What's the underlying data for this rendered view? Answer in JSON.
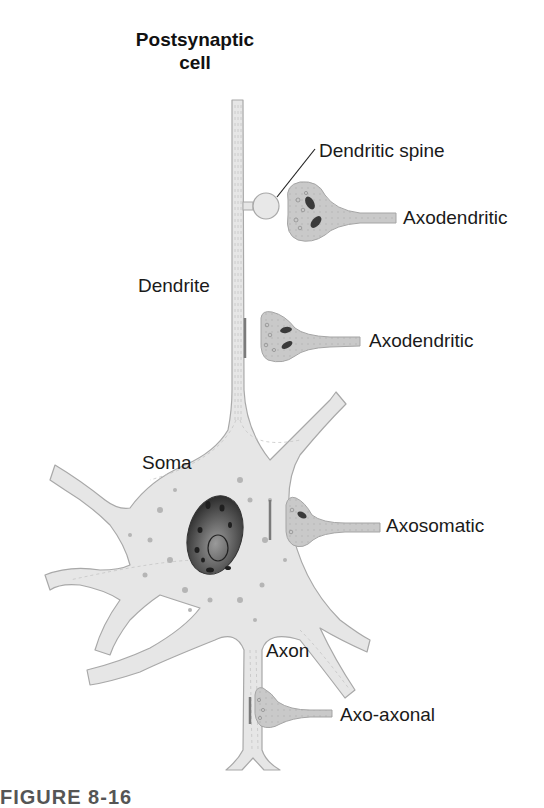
{
  "diagram": {
    "title_line1": "Postsynaptic",
    "title_line2": "cell",
    "labels": {
      "dendritic_spine": "Dendritic spine",
      "axodendritic_1": "Axodendritic",
      "dendrite": "Dendrite",
      "axodendritic_2": "Axodendritic",
      "soma": "Soma",
      "axosomatic": "Axosomatic",
      "axon": "Axon",
      "axo_axonal": "Axo-axonal"
    },
    "caption_partial": "FIGURE 8-16",
    "colors": {
      "cell_fill": "#e6e6e6",
      "cell_stroke": "#a8a8a8",
      "terminal_fill": "#c9c9c9",
      "nucleus_fill": "#5a5a5a",
      "text": "#1a1a1a",
      "background": "#ffffff"
    }
  }
}
